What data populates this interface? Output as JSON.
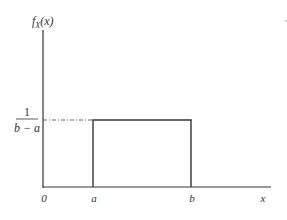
{
  "diagram": {
    "y_axis_label": "f_X(x)",
    "y_axis_label_main": "f",
    "y_axis_label_sub": "X",
    "y_axis_label_arg": "(x)",
    "x_axis_label": "x",
    "height_label_numerator": "1",
    "height_label_denominator": "b − a",
    "origin_label": "0",
    "lower_bound_label": "a",
    "upper_bound_label": "b",
    "line_color": "#333333"
  }
}
